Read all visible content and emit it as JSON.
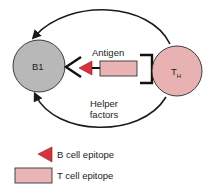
{
  "diagram": {
    "cells": {
      "b_cell": {
        "label": "B1",
        "fill": "#b8b8b8"
      },
      "t_helper": {
        "label_main": "T",
        "label_sub": "H",
        "fill": "#e9b2b2"
      }
    },
    "labels": {
      "antigen": "Antigen",
      "helper_line1": "Helper",
      "helper_line2": "factors"
    },
    "legend": [
      {
        "symbol": "red-triangle",
        "color": "#d8333d",
        "label": "B cell epitope"
      },
      {
        "symbol": "pink-rectangle",
        "color": "#eab4b4",
        "label": "T cell epitope"
      }
    ],
    "colors": {
      "stroke": "#1a1a1a",
      "b_epitope": "#d8333d",
      "t_epitope": "#eab4b4"
    }
  }
}
